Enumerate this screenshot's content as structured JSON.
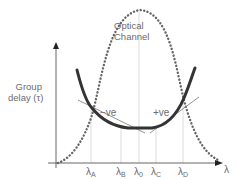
{
  "diagram": {
    "y_axis_label_line1": "Group",
    "y_axis_label_line2": "delay (τ)",
    "x_axis_label": "λ",
    "channel_label_line1": "Optical",
    "channel_label_line2": "Channel",
    "negative_slope_label": "−ve",
    "positive_slope_label": "+ve",
    "ticks": [
      {
        "symbol": "λ",
        "sub": "A"
      },
      {
        "symbol": "λ",
        "sub": "B"
      },
      {
        "symbol": "λ",
        "sub": "0"
      },
      {
        "symbol": "λ",
        "sub": "C"
      },
      {
        "symbol": "λ",
        "sub": "D"
      }
    ],
    "colors": {
      "axis": "#555555",
      "guide": "#cfcfcf",
      "dotted_curve": "#666666",
      "delay_curve": "#333333",
      "tangent": "#888888",
      "text": "#6b6b6b"
    }
  }
}
